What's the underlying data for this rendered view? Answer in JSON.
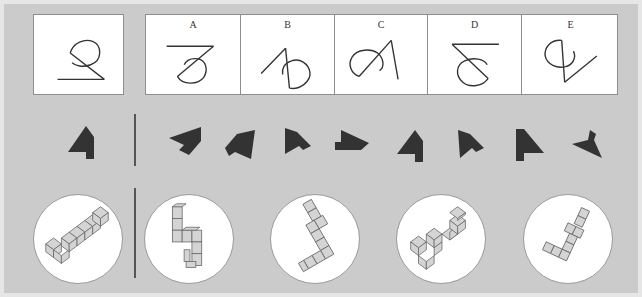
{
  "colors": {
    "background": "#cbcbcb",
    "outer_border": "#e6e6e6",
    "box_fill": "#ffffff",
    "box_border": "#8e8e8e",
    "stroke": "#333333",
    "shape_fill": "#333333",
    "cube_fill": "#d4d4d4",
    "cube_edge": "#666666"
  },
  "row1": {
    "reference": {
      "id": "ref",
      "icon": "loop-line-figure"
    },
    "options": [
      {
        "label": "A",
        "icon": "loop-line-figure-a"
      },
      {
        "label": "B",
        "icon": "loop-line-figure-b"
      },
      {
        "label": "C",
        "icon": "loop-line-figure-c"
      },
      {
        "label": "D",
        "icon": "loop-line-figure-d"
      },
      {
        "label": "E",
        "icon": "loop-line-figure-e"
      }
    ]
  },
  "row2": {
    "reference": {
      "icon": "arrow-polygon",
      "rotation": 0,
      "mirror": false
    },
    "options": [
      {
        "icon": "arrow-polygon",
        "rotation": -70,
        "mirror": false
      },
      {
        "icon": "arrow-polygon",
        "rotation": -20,
        "mirror": false
      },
      {
        "icon": "arrow-polygon",
        "rotation": 60,
        "mirror": true
      },
      {
        "icon": "arrow-polygon",
        "rotation": 90,
        "mirror": true
      },
      {
        "icon": "arrow-polygon",
        "rotation": 0,
        "mirror": false
      },
      {
        "icon": "arrow-polygon",
        "rotation": 35,
        "mirror": true
      },
      {
        "icon": "arrow-polygon",
        "rotation": 0,
        "mirror": true
      },
      {
        "icon": "arrow-polygon",
        "rotation": -110,
        "mirror": true
      }
    ]
  },
  "row3": {
    "reference": {
      "icon": "cube-assembly"
    },
    "options": [
      {
        "icon": "cube-assembly-1"
      },
      {
        "icon": "cube-assembly-2"
      },
      {
        "icon": "cube-assembly-3"
      },
      {
        "icon": "cube-assembly-4"
      }
    ]
  }
}
